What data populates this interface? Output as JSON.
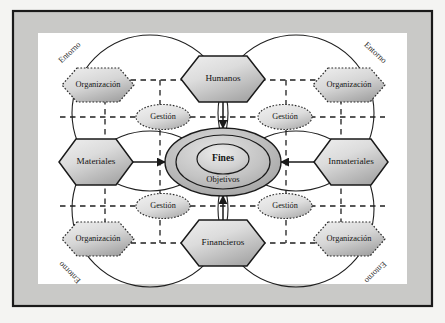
{
  "figure": {
    "background_color": "#f2f2f0",
    "frame_border_color": "#1a1a1a",
    "frame_band_color": "#c9c9c7",
    "canvas_color": "#ffffff",
    "line_color": "#1a1a1a",
    "shape_fill_light": "#e6e6e6",
    "shape_fill_dark": "#a8a8a8"
  },
  "center": {
    "inner_label": "Fines",
    "outer_label": "Objetivos"
  },
  "resources": [
    {
      "id": "humanos",
      "label": "Humanos",
      "position": "top"
    },
    {
      "id": "materiales",
      "label": "Materiales",
      "position": "left"
    },
    {
      "id": "inmateriales",
      "label": "Inmateriales",
      "position": "right"
    },
    {
      "id": "financieros",
      "label": "Financieros",
      "position": "bottom"
    }
  ],
  "management": [
    {
      "id": "gestion-tl",
      "label": "Gestión",
      "position": "top-left"
    },
    {
      "id": "gestion-tr",
      "label": "Gestión",
      "position": "top-right"
    },
    {
      "id": "gestion-bl",
      "label": "Gestión",
      "position": "bottom-left"
    },
    {
      "id": "gestion-br",
      "label": "Gestión",
      "position": "bottom-right"
    }
  ],
  "organizations": [
    {
      "id": "org-tl",
      "label": "Organización",
      "position": "top-left"
    },
    {
      "id": "org-tr",
      "label": "Organización",
      "position": "top-right"
    },
    {
      "id": "org-bl",
      "label": "Organización",
      "position": "bottom-left"
    },
    {
      "id": "org-br",
      "label": "Organización",
      "position": "bottom-right"
    }
  ],
  "environment": [
    {
      "id": "entorno-tl",
      "label": "Entorno",
      "position": "top-left",
      "rotation": -45
    },
    {
      "id": "entorno-tr",
      "label": "Entorno",
      "position": "top-right",
      "rotation": 45
    },
    {
      "id": "entorno-bl",
      "label": "Entorno",
      "position": "bottom-left",
      "rotation": -135
    },
    {
      "id": "entorno-br",
      "label": "Entorno",
      "position": "bottom-right",
      "rotation": 135
    }
  ]
}
